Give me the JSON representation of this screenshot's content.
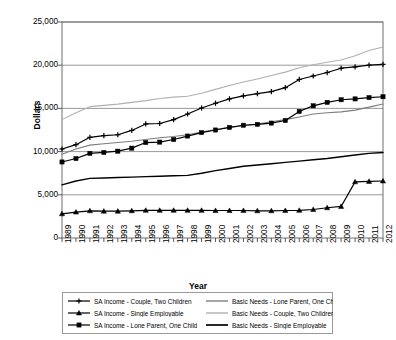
{
  "chart_data": {
    "type": "line",
    "title": "",
    "xlabel": "Year",
    "ylabel": "Dollars",
    "ylim": [
      0,
      25000
    ],
    "yticks": [
      0,
      5000,
      10000,
      15000,
      20000,
      25000
    ],
    "ytick_labels": [
      "0",
      "5,000",
      "10,000",
      "15,000",
      "20,000",
      "25,000"
    ],
    "grid": true,
    "legend_position": "bottom",
    "x": [
      1989,
      1990,
      1991,
      1992,
      1993,
      1994,
      1995,
      1996,
      1997,
      1998,
      1999,
      2000,
      2001,
      2002,
      2003,
      2004,
      2005,
      2006,
      2007,
      2008,
      2009,
      2010,
      2011,
      2012
    ],
    "categories": [
      "1989",
      "1990",
      "1991",
      "1992",
      "1993",
      "1994",
      "1995",
      "1996",
      "1997",
      "1998",
      "1999",
      "2000",
      "2001",
      "2002",
      "2003",
      "2004",
      "2005",
      "2006",
      "2007",
      "2008",
      "2009",
      "2010",
      "2011",
      "2012"
    ],
    "series": [
      {
        "name": "SA Income - Couple, Two Children",
        "color": "#000000",
        "marker": "plus",
        "width": 1.2,
        "values": [
          10300,
          10800,
          11650,
          11850,
          11950,
          12450,
          13200,
          13250,
          13700,
          14350,
          15050,
          15600,
          16100,
          16450,
          16700,
          16950,
          17400,
          18350,
          18750,
          19150,
          19650,
          19800,
          20000,
          20100
        ]
      },
      {
        "name": "SA Income - Single Employable",
        "color": "#000000",
        "marker": "triangle",
        "width": 1.2,
        "values": [
          2800,
          3000,
          3150,
          3100,
          3100,
          3150,
          3200,
          3200,
          3200,
          3200,
          3200,
          3180,
          3180,
          3180,
          3150,
          3150,
          3180,
          3200,
          3300,
          3500,
          3650,
          6500,
          6550,
          6600
        ]
      },
      {
        "name": "SA Income - Lone Parent, One Child",
        "color": "#000000",
        "marker": "square",
        "width": 1.2,
        "values": [
          8800,
          9200,
          9800,
          9900,
          10050,
          10400,
          11050,
          11100,
          11400,
          11800,
          12200,
          12500,
          12800,
          13050,
          13150,
          13300,
          13600,
          14650,
          15300,
          15700,
          16000,
          16100,
          16250,
          16350
        ]
      },
      {
        "name": "Basic Needs - Lone Parent, One Child",
        "color": "#7d7d7d",
        "marker": "none",
        "width": 1.1,
        "values": [
          9700,
          10300,
          10750,
          10900,
          11050,
          11200,
          11400,
          11600,
          11750,
          11950,
          12250,
          12550,
          12800,
          13000,
          13200,
          13450,
          13700,
          14000,
          14350,
          14500,
          14600,
          14800,
          15150,
          15500
        ]
      },
      {
        "name": "Basic Needs - Couple, Two Children",
        "color": "#b0b0b0",
        "marker": "none",
        "width": 1.1,
        "values": [
          13700,
          14500,
          15200,
          15350,
          15500,
          15700,
          15900,
          16150,
          16300,
          16400,
          16750,
          17200,
          17650,
          18050,
          18400,
          18800,
          19200,
          19700,
          20050,
          20350,
          20600,
          21100,
          21700,
          22100
        ]
      },
      {
        "name": "Basic Needs - Single Employable",
        "color": "#000000",
        "marker": "none",
        "width": 1.4,
        "values": [
          6150,
          6600,
          6900,
          6950,
          7000,
          7050,
          7100,
          7150,
          7200,
          7250,
          7500,
          7800,
          8050,
          8300,
          8450,
          8600,
          8750,
          8900,
          9050,
          9200,
          9400,
          9600,
          9800,
          9900
        ]
      }
    ]
  },
  "legend": {
    "left_items": [
      "SA Income - Couple, Two Children",
      "SA Income - Single Employable",
      "SA Income - Lone Parent, One Child"
    ],
    "right_items": [
      "Basic Needs - Lone Parent, One Child",
      "Basic Needs - Couple, Two Children",
      "Basic Needs - Single Employable"
    ]
  }
}
